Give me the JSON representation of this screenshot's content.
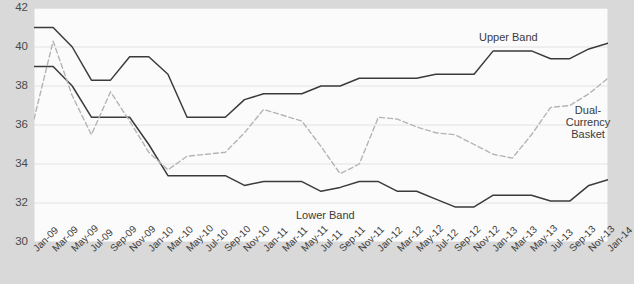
{
  "chart_data": {
    "type": "line",
    "title": "",
    "xlabel": "",
    "ylabel": "",
    "ylim": [
      30,
      42
    ],
    "yticks": [
      30,
      32,
      34,
      36,
      38,
      40,
      42
    ],
    "grid": true,
    "legend_position": "inline-annotations",
    "x": [
      "Jan-09",
      "Mar-09",
      "May-09",
      "Jul-09",
      "Sep-09",
      "Nov-09",
      "Jan-10",
      "Mar-10",
      "May-10",
      "Jul-10",
      "Sep-10",
      "Nov-10",
      "Jan-11",
      "Mar-11",
      "May-11",
      "Jul-11",
      "Sep-11",
      "Nov-11",
      "Jan-12",
      "Mar-12",
      "May-12",
      "Jul-12",
      "Sep-12",
      "Nov-12",
      "Jan-13",
      "Mar-13",
      "May-13",
      "Jul-13",
      "Sep-13",
      "Nov-13",
      "Jan-14"
    ],
    "series": [
      {
        "name": "Upper Band",
        "style": "solid",
        "color": "#3b3b3b",
        "values": [
          41.0,
          41.0,
          40.0,
          38.3,
          38.3,
          39.5,
          39.5,
          38.6,
          36.4,
          36.4,
          36.4,
          37.3,
          37.6,
          37.6,
          37.6,
          38.0,
          38.0,
          38.4,
          38.4,
          38.4,
          38.4,
          38.6,
          38.6,
          38.6,
          39.8,
          39.8,
          39.8,
          39.4,
          39.4,
          39.9,
          40.2
        ]
      },
      {
        "name": "Lower Band",
        "style": "solid",
        "color": "#3b3b3b",
        "values": [
          39.0,
          39.0,
          38.0,
          36.4,
          36.4,
          36.4,
          35.0,
          33.4,
          33.4,
          33.4,
          33.4,
          32.9,
          33.1,
          33.1,
          33.1,
          32.6,
          32.8,
          33.1,
          33.1,
          32.6,
          32.6,
          32.2,
          31.8,
          31.8,
          32.4,
          32.4,
          32.4,
          32.1,
          32.1,
          32.9,
          33.2
        ]
      },
      {
        "name": "Dual-Currency Basket",
        "style": "dashed",
        "color": "#b4b4b4",
        "values": [
          36.3,
          40.3,
          37.5,
          35.5,
          37.7,
          36.2,
          34.6,
          33.7,
          34.4,
          34.5,
          34.6,
          35.6,
          36.8,
          36.5,
          36.2,
          34.9,
          33.5,
          34.0,
          36.4,
          36.3,
          35.9,
          35.6,
          35.5,
          35.0,
          34.5,
          34.3,
          35.5,
          36.9,
          37.0,
          37.6,
          38.4
        ]
      }
    ],
    "annotations": [
      {
        "name": "upper-band-label",
        "text": "Upper Band"
      },
      {
        "name": "lower-band-label",
        "text": "Lower Band"
      },
      {
        "name": "basket-label-line1",
        "text": "Dual-"
      },
      {
        "name": "basket-label-line2",
        "text": "Currency"
      },
      {
        "name": "basket-label-line3",
        "text": "Basket"
      }
    ]
  }
}
